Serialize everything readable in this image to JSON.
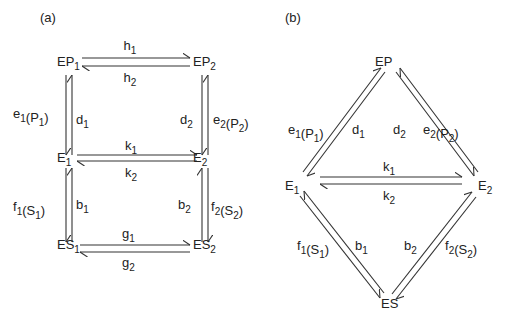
{
  "panels": [
    {
      "id": "a",
      "label": "(a)",
      "nodes": {
        "EP1": {
          "base": "EP",
          "sub": "1"
        },
        "EP2": {
          "base": "EP",
          "sub": "2"
        },
        "E1": {
          "base": "E",
          "sub": "1"
        },
        "E2": {
          "base": "E",
          "sub": "2"
        },
        "ES1": {
          "base": "ES",
          "sub": "1"
        },
        "ES2": {
          "base": "ES",
          "sub": "2"
        }
      },
      "edges": [
        {
          "from": "EP1",
          "to": "EP2",
          "label": {
            "base": "h",
            "sub": "1"
          }
        },
        {
          "from": "EP2",
          "to": "EP1",
          "label": {
            "base": "h",
            "sub": "2"
          }
        },
        {
          "from": "E1",
          "to": "EP1",
          "label": {
            "base": "e",
            "sub": "1",
            "arg": "P",
            "argsub": "1"
          }
        },
        {
          "from": "EP1",
          "to": "E1",
          "label": {
            "base": "d",
            "sub": "1"
          }
        },
        {
          "from": "E2",
          "to": "EP2",
          "label": {
            "base": "e",
            "sub": "2",
            "arg": "P",
            "argsub": "2"
          }
        },
        {
          "from": "EP2",
          "to": "E2",
          "label": {
            "base": "d",
            "sub": "2"
          }
        },
        {
          "from": "E1",
          "to": "E2",
          "label": {
            "base": "k",
            "sub": "1"
          }
        },
        {
          "from": "E2",
          "to": "E1",
          "label": {
            "base": "k",
            "sub": "2"
          }
        },
        {
          "from": "E1",
          "to": "ES1",
          "label": {
            "base": "f",
            "sub": "1",
            "arg": "S",
            "argsub": "1"
          }
        },
        {
          "from": "ES1",
          "to": "E1",
          "label": {
            "base": "b",
            "sub": "1"
          }
        },
        {
          "from": "E2",
          "to": "ES2",
          "label": {
            "base": "f",
            "sub": "2",
            "arg": "S",
            "argsub": "2"
          }
        },
        {
          "from": "ES2",
          "to": "E2",
          "label": {
            "base": "b",
            "sub": "2"
          }
        },
        {
          "from": "ES1",
          "to": "ES2",
          "label": {
            "base": "g",
            "sub": "1"
          }
        },
        {
          "from": "ES2",
          "to": "ES1",
          "label": {
            "base": "g",
            "sub": "2"
          }
        }
      ]
    },
    {
      "id": "b",
      "label": "(b)",
      "nodes": {
        "EP": {
          "base": "EP",
          "sub": ""
        },
        "E1": {
          "base": "E",
          "sub": "1"
        },
        "E2": {
          "base": "E",
          "sub": "2"
        },
        "ES": {
          "base": "ES",
          "sub": ""
        }
      },
      "edges": [
        {
          "from": "E1",
          "to": "EP",
          "label": {
            "base": "e",
            "sub": "1",
            "arg": "P",
            "argsub": "1"
          }
        },
        {
          "from": "EP",
          "to": "E1",
          "label": {
            "base": "d",
            "sub": "1"
          }
        },
        {
          "from": "E2",
          "to": "EP",
          "label": {
            "base": "e",
            "sub": "2",
            "arg": "P",
            "argsub": "2"
          }
        },
        {
          "from": "EP",
          "to": "E2",
          "label": {
            "base": "d",
            "sub": "2"
          }
        },
        {
          "from": "E1",
          "to": "E2",
          "label": {
            "base": "k",
            "sub": "1"
          }
        },
        {
          "from": "E2",
          "to": "E1",
          "label": {
            "base": "k",
            "sub": "2"
          }
        },
        {
          "from": "E1",
          "to": "ES",
          "label": {
            "base": "f",
            "sub": "1",
            "arg": "S",
            "argsub": "1"
          }
        },
        {
          "from": "ES",
          "to": "E1",
          "label": {
            "base": "b",
            "sub": "1"
          }
        },
        {
          "from": "E2",
          "to": "ES",
          "label": {
            "base": "f",
            "sub": "2",
            "arg": "S",
            "argsub": "2"
          }
        },
        {
          "from": "ES",
          "to": "E2",
          "label": {
            "base": "b",
            "sub": "2"
          }
        }
      ]
    }
  ]
}
